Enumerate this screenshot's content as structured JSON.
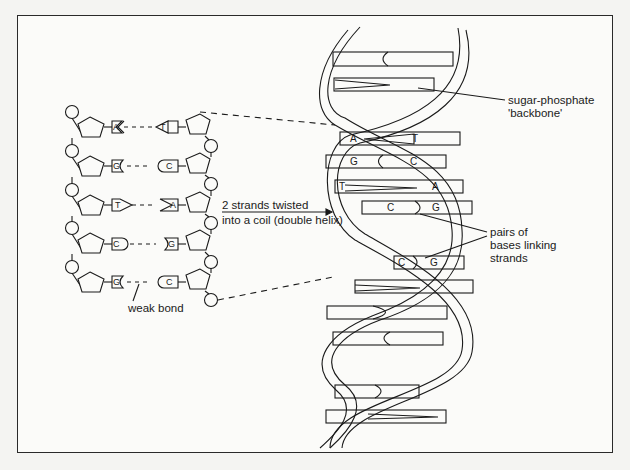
{
  "figure": {
    "labels": {
      "backbone_line1": "sugar-phosphate",
      "backbone_line2": "'backbone'",
      "pairs_line1": "pairs of",
      "pairs_line2": "bases linking",
      "pairs_line3": "strands",
      "arrow_line1": "2 strands twisted",
      "arrow_line2": "into a coil (double helix)",
      "weak_bond": "weak bond"
    },
    "flat_strand_pairs": [
      {
        "left": "A",
        "right": "T"
      },
      {
        "left": "G",
        "right": "C"
      },
      {
        "left": "T",
        "right": "A"
      },
      {
        "left": "C",
        "right": "G"
      },
      {
        "left": "G",
        "right": "C"
      }
    ],
    "helix_labeled_pairs": [
      {
        "left": "A",
        "right": "T"
      },
      {
        "left": "G",
        "right": "C"
      },
      {
        "left": "T",
        "right": "A"
      },
      {
        "left": "C",
        "right": "G"
      },
      {
        "left": "C",
        "right": "G"
      }
    ]
  }
}
